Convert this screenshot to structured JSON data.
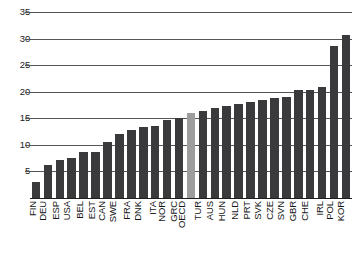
{
  "chart_data": {
    "type": "bar",
    "title": "",
    "subtitle": "",
    "xlabel": "",
    "ylabel": "",
    "ylim": [
      0,
      35
    ],
    "yticks": [
      5,
      10,
      15,
      20,
      25,
      30,
      35
    ],
    "grid": true,
    "legend": "none",
    "highlight_category": "OECD",
    "colors": {
      "bar": "#3a3a3c",
      "highlight_bar": "#9d9d9d",
      "gridline": "#55555a",
      "axis": "#1d1d1d",
      "text": "#151515",
      "background": "#ffffff"
    },
    "categories": [
      "FIN",
      "DEU",
      "ESP",
      "USA",
      "BEL",
      "EST",
      "CAN",
      "SWE",
      "FRA",
      "DNK",
      "ITA",
      "NOR",
      "GRC",
      "OECD",
      "TUR",
      "AUS",
      "HUN",
      "NLD",
      "PRT",
      "SVK",
      "CZE",
      "SVN",
      "GBR",
      "CHE",
      "IRL",
      "POL",
      "KOR"
    ],
    "values": [
      3.0,
      6.3,
      7.2,
      7.6,
      8.6,
      8.7,
      10.6,
      12.0,
      12.8,
      13.3,
      13.5,
      14.6,
      15.0,
      16.0,
      16.3,
      17.0,
      17.3,
      17.6,
      18.0,
      18.4,
      18.9,
      19.1,
      20.3,
      20.4,
      20.9,
      28.6,
      30.7
    ],
    "series": [
      {
        "name": "value",
        "values": [
          3.0,
          6.3,
          7.2,
          7.6,
          8.6,
          8.7,
          10.6,
          12.0,
          12.8,
          13.3,
          13.5,
          14.6,
          15.0,
          16.0,
          16.3,
          17.0,
          17.3,
          17.6,
          18.0,
          18.4,
          18.9,
          19.1,
          20.3,
          20.4,
          20.9,
          28.6,
          30.7
        ]
      }
    ]
  }
}
